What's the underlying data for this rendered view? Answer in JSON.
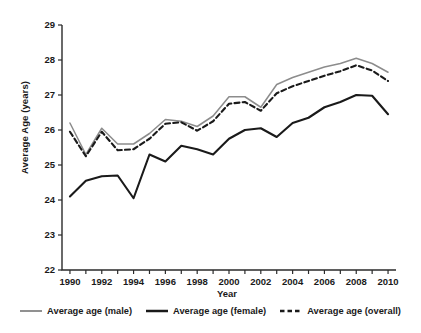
{
  "chart_data": {
    "type": "line",
    "title": "",
    "xlabel": "Year",
    "ylabel": "Average Age (years)",
    "xlim": [
      1989.5,
      2010.5
    ],
    "ylim": [
      22,
      29
    ],
    "yticks": [
      22,
      23,
      24,
      25,
      26,
      27,
      28,
      29
    ],
    "xticks": [
      1990,
      1991,
      1992,
      1993,
      1994,
      1995,
      1996,
      1997,
      1998,
      1999,
      2000,
      2001,
      2002,
      2003,
      2004,
      2005,
      2006,
      2007,
      2008,
      2009,
      2010
    ],
    "xtick_labels": [
      "1990",
      "",
      "1992",
      "",
      "1994",
      "",
      "1996",
      "",
      "1998",
      "",
      "2000",
      "",
      "2002",
      "",
      "2004",
      "",
      "2006",
      "",
      "2008",
      "",
      "2010"
    ],
    "ytick_labels": [
      "22",
      "23",
      "24",
      "25",
      "26",
      "27",
      "28",
      "29"
    ],
    "grid": false,
    "legend_position": "bottom",
    "x": [
      1990,
      1991,
      1992,
      1993,
      1994,
      1995,
      1996,
      1997,
      1998,
      1999,
      2000,
      2001,
      2002,
      2003,
      2004,
      2005,
      2006,
      2007,
      2008,
      2009,
      2010
    ],
    "series": [
      {
        "name": "Average age (male)",
        "color": "#8c8c8c",
        "style": "solid",
        "width": 1.5,
        "values": [
          26.2,
          25.3,
          26.05,
          25.6,
          25.6,
          25.9,
          26.3,
          26.25,
          26.1,
          26.4,
          26.95,
          26.95,
          26.65,
          27.3,
          27.5,
          27.65,
          27.8,
          27.9,
          28.05,
          27.9,
          27.65
        ]
      },
      {
        "name": "Average age (female)",
        "color": "#1a1a1a",
        "style": "solid",
        "width": 2.1,
        "values": [
          24.1,
          24.55,
          24.68,
          24.7,
          24.05,
          25.3,
          25.1,
          25.55,
          25.45,
          25.3,
          25.75,
          26.0,
          26.05,
          25.8,
          26.2,
          26.35,
          26.65,
          26.8,
          27.0,
          26.98,
          26.45
        ]
      },
      {
        "name": "Average age (overall)",
        "color": "#1a1a1a",
        "style": "dashed",
        "width": 2.1,
        "values": [
          25.95,
          25.25,
          25.95,
          25.42,
          25.45,
          25.75,
          26.18,
          26.22,
          25.98,
          26.25,
          26.75,
          26.8,
          26.55,
          27.05,
          27.25,
          27.4,
          27.55,
          27.68,
          27.85,
          27.7,
          27.4
        ]
      }
    ]
  },
  "legend": {
    "items": [
      {
        "label": "Average age (male)"
      },
      {
        "label": "Average age (female)"
      },
      {
        "label": "Average age (overall)"
      }
    ]
  },
  "axes": {
    "y_title": "Average Age (years)",
    "x_title": "Year"
  }
}
